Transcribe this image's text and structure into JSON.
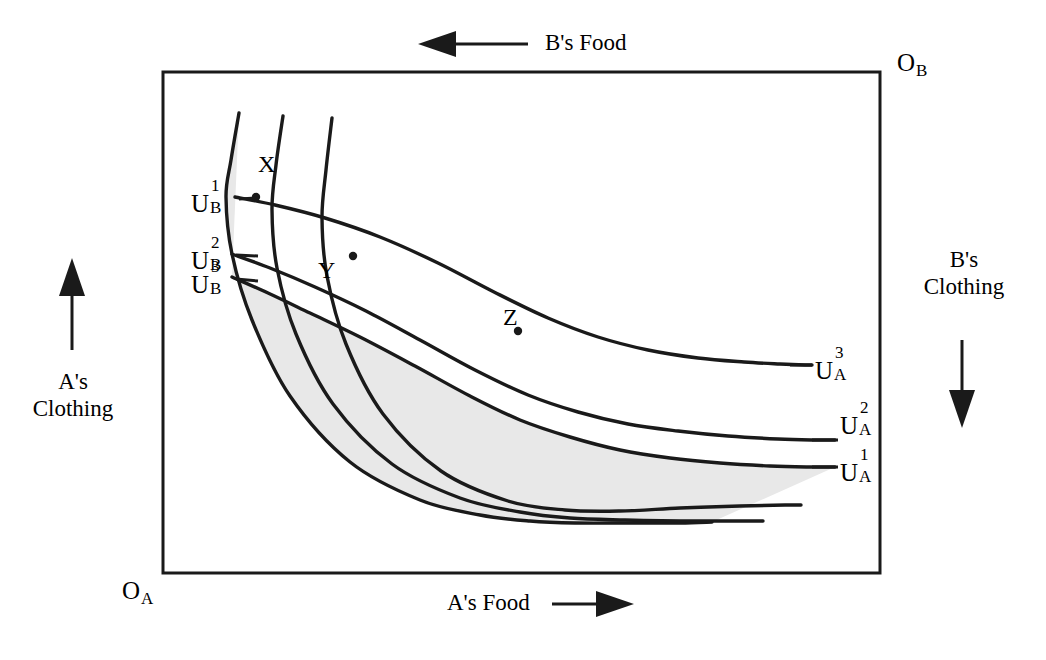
{
  "figure": {
    "type": "edgeworth-box",
    "background": "#ffffff",
    "line_color": "#1a1a1a",
    "shade_color": "#e8e8e8"
  },
  "axes": {
    "top": {
      "label": "B's Food",
      "arrow": "left-arrow-icon",
      "direction": "left"
    },
    "bottom": {
      "label": "A's Food",
      "arrow": "right-arrow-icon",
      "direction": "right"
    },
    "left": {
      "line1": "A's",
      "line2": "Clothing",
      "arrow": "up-arrow-icon",
      "direction": "up"
    },
    "right": {
      "line1": "B's",
      "line2": "Clothing",
      "arrow": "down-arrow-icon",
      "direction": "down"
    }
  },
  "origins": {
    "a": {
      "letter": "O",
      "subscript": "A"
    },
    "b": {
      "letter": "O",
      "subscript": "B"
    }
  },
  "curve_labels": {
    "b": [
      {
        "letter": "U",
        "sup": "1",
        "sub": "B"
      },
      {
        "letter": "U",
        "sup": "2",
        "sub": "B"
      },
      {
        "letter": "U",
        "sup": "3",
        "sub": "B"
      }
    ],
    "a": [
      {
        "letter": "U",
        "sup": "3",
        "sub": "A"
      },
      {
        "letter": "U",
        "sup": "2",
        "sub": "A"
      },
      {
        "letter": "U",
        "sup": "1",
        "sub": "A"
      }
    ]
  },
  "points": [
    {
      "id": "X",
      "label": "X"
    },
    {
      "id": "Y",
      "label": "Y"
    },
    {
      "id": "Z",
      "label": "Z"
    }
  ],
  "chart_data": {
    "type": "line",
    "title": "",
    "xlabel": "A's Food",
    "ylabel": "A's Clothing",
    "grid": false,
    "legend": "inline-curve-labels",
    "box": {
      "x0": 163,
      "y0": 72,
      "x1": 880,
      "y1": 573
    },
    "shaded_region": {
      "name": "lens-of-mutual-gain",
      "upper_bound": "U_B^1",
      "lower_bound": "U_A^1",
      "color": "#e8e8e8"
    },
    "series": [
      {
        "name": "U_B^1",
        "owner": "B",
        "index": 1,
        "points": [
          [
            239,
            113
          ],
          [
            231,
            160
          ],
          [
            226,
            197
          ],
          [
            232,
            254
          ],
          [
            252,
            320
          ],
          [
            290,
            396
          ],
          [
            350,
            462
          ],
          [
            420,
            500
          ],
          [
            480,
            515
          ],
          [
            530,
            521
          ],
          [
            575,
            523
          ],
          [
            630,
            523
          ],
          [
            680,
            523
          ],
          [
            712,
            522
          ]
        ]
      },
      {
        "name": "U_B^2",
        "owner": "B",
        "index": 2,
        "points": [
          [
            283,
            116
          ],
          [
            276,
            165
          ],
          [
            272,
            210
          ],
          [
            277,
            268
          ],
          [
            296,
            334
          ],
          [
            333,
            404
          ],
          [
            392,
            464
          ],
          [
            460,
            498
          ],
          [
            520,
            512
          ],
          [
            570,
            518
          ],
          [
            625,
            520
          ],
          [
            680,
            521
          ],
          [
            730,
            521
          ],
          [
            763,
            521
          ]
        ]
      },
      {
        "name": "U_B^3",
        "owner": "B",
        "index": 3,
        "points": [
          [
            332,
            118
          ],
          [
            326,
            170
          ],
          [
            322,
            218
          ],
          [
            327,
            276
          ],
          [
            346,
            344
          ],
          [
            383,
            414
          ],
          [
            441,
            471
          ],
          [
            508,
            501
          ],
          [
            565,
            510
          ],
          [
            620,
            511
          ],
          [
            680,
            508
          ],
          [
            740,
            506
          ],
          [
            785,
            505
          ],
          [
            801,
            505
          ]
        ]
      },
      {
        "name": "U_A^1",
        "owner": "A",
        "index": 1,
        "points": [
          [
            232,
            277
          ],
          [
            268,
            293
          ],
          [
            310,
            313
          ],
          [
            360,
            337
          ],
          [
            415,
            366
          ],
          [
            470,
            396
          ],
          [
            520,
            420
          ],
          [
            570,
            437
          ],
          [
            620,
            450
          ],
          [
            670,
            458
          ],
          [
            720,
            463
          ],
          [
            770,
            466
          ],
          [
            810,
            467
          ],
          [
            835,
            467
          ]
        ]
      },
      {
        "name": "U_A^2",
        "owner": "A",
        "index": 2,
        "points": [
          [
            232,
            254
          ],
          [
            270,
            268
          ],
          [
            315,
            287
          ],
          [
            366,
            311
          ],
          [
            420,
            340
          ],
          [
            475,
            370
          ],
          [
            528,
            395
          ],
          [
            578,
            412
          ],
          [
            628,
            424
          ],
          [
            678,
            431
          ],
          [
            728,
            436
          ],
          [
            778,
            439
          ],
          [
            815,
            440
          ],
          [
            835,
            440
          ]
        ]
      },
      {
        "name": "U_A^3",
        "owner": "A",
        "index": 3,
        "points": [
          [
            235,
            197
          ],
          [
            275,
            205
          ],
          [
            325,
            218
          ],
          [
            380,
            237
          ],
          [
            438,
            263
          ],
          [
            494,
            292
          ],
          [
            548,
            318
          ],
          [
            598,
            337
          ],
          [
            648,
            350
          ],
          [
            698,
            358
          ],
          [
            744,
            362
          ],
          [
            780,
            364
          ],
          [
            805,
            365
          ],
          [
            812,
            365
          ]
        ]
      }
    ],
    "marked_points": [
      {
        "label": "X",
        "x": 256,
        "y": 197,
        "on": [
          "U_B^1",
          "U_A^3"
        ]
      },
      {
        "label": "Y",
        "x": 353,
        "y": 256,
        "on": [
          "U_B^2",
          "U_A^2"
        ]
      },
      {
        "label": "Z",
        "x": 518,
        "y": 331,
        "on": [
          "U_B^3",
          "U_A^1"
        ]
      }
    ]
  }
}
